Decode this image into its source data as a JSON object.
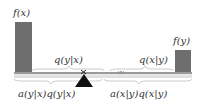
{
  "diagram": {
    "labels": {
      "fx": "f(x)",
      "fy": "f(y)",
      "q_y_given_x": "q(y|x)",
      "q_x_given_y": "q(x|y)",
      "flow_left": "a(y|x)q(y|x)",
      "flow_right": "a(x|y)q(x|y)"
    },
    "colors": {
      "bar": "#6e6e6e",
      "beam": "#9a9a9a",
      "beam_light": "#d0d0d0",
      "fulcrum": "#111111",
      "text": "#333333"
    }
  }
}
